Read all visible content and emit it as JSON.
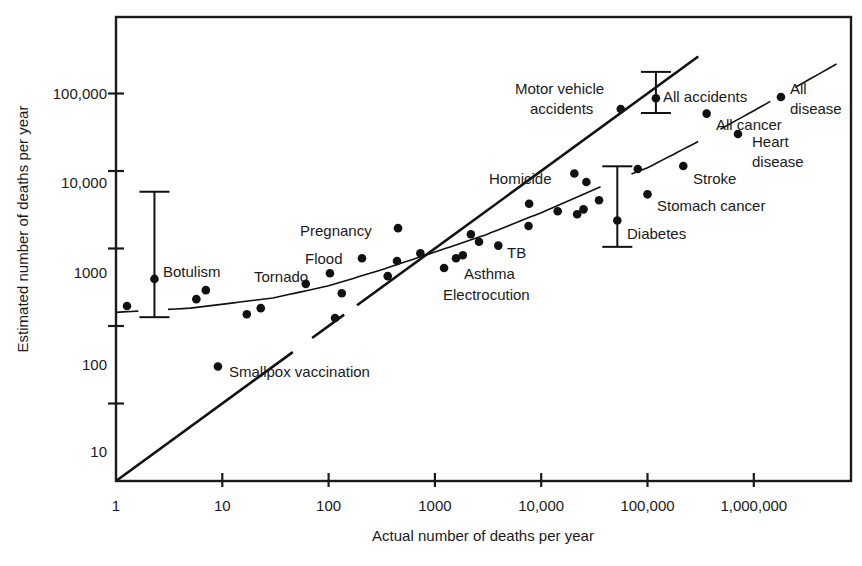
{
  "chart_data": {
    "type": "scatter",
    "title": "",
    "xlabel": "Actual number of deaths per year",
    "ylabel": "Estimated number of deaths per year",
    "xscale": "log",
    "yscale": "log",
    "xlim": [
      1,
      7000000
    ],
    "ylim": [
      1,
      450000
    ],
    "grid": false,
    "legend": null,
    "x_ticks": [
      {
        "value": 1,
        "label": "1"
      },
      {
        "value": 10,
        "label": "10"
      },
      {
        "value": 100,
        "label": "100"
      },
      {
        "value": 1000,
        "label": "1000"
      },
      {
        "value": 10000,
        "label": "10,000"
      },
      {
        "value": 100000,
        "label": "100,000"
      },
      {
        "value": 1000000,
        "label": "1,000,000"
      }
    ],
    "y_ticks": [
      {
        "value": 10,
        "label": "10"
      },
      {
        "value": 100,
        "label": "100"
      },
      {
        "value": 1000,
        "label": "1000"
      },
      {
        "value": 10000,
        "label": "10,000"
      },
      {
        "value": 100000,
        "label": "100,000"
      }
    ],
    "series": [
      {
        "name": "Causes of death",
        "points": [
          {
            "x": 1.27,
            "y": 181,
            "label": ""
          },
          {
            "x": 2.3,
            "y": 405,
            "label": "Botulism"
          },
          {
            "x": 5.7,
            "y": 222,
            "label": ""
          },
          {
            "x": 7.0,
            "y": 290,
            "label": ""
          },
          {
            "x": 9.1,
            "y": 30,
            "label": "Smallpox vaccination"
          },
          {
            "x": 17,
            "y": 142,
            "label": ""
          },
          {
            "x": 23,
            "y": 170,
            "label": ""
          },
          {
            "x": 61,
            "y": 350,
            "label": "Tornado"
          },
          {
            "x": 103,
            "y": 480,
            "label": ""
          },
          {
            "x": 115,
            "y": 127,
            "label": ""
          },
          {
            "x": 133,
            "y": 265,
            "label": ""
          },
          {
            "x": 206,
            "y": 750,
            "label": "Flood"
          },
          {
            "x": 360,
            "y": 440,
            "label": ""
          },
          {
            "x": 440,
            "y": 690,
            "label": ""
          },
          {
            "x": 450,
            "y": 1830,
            "label": "Pregnancy"
          },
          {
            "x": 730,
            "y": 870,
            "label": ""
          },
          {
            "x": 1220,
            "y": 560,
            "label": "Electrocution"
          },
          {
            "x": 1580,
            "y": 750,
            "label": "Asthma"
          },
          {
            "x": 1830,
            "y": 820,
            "label": ""
          },
          {
            "x": 2180,
            "y": 1530,
            "label": ""
          },
          {
            "x": 2600,
            "y": 1220,
            "label": ""
          },
          {
            "x": 3950,
            "y": 1090,
            "label": "TB"
          },
          {
            "x": 7600,
            "y": 1950,
            "label": ""
          },
          {
            "x": 7700,
            "y": 3780,
            "label": ""
          },
          {
            "x": 14300,
            "y": 3030,
            "label": ""
          },
          {
            "x": 20500,
            "y": 9300,
            "label": "Homicide"
          },
          {
            "x": 21800,
            "y": 2770,
            "label": ""
          },
          {
            "x": 25000,
            "y": 3200,
            "label": ""
          },
          {
            "x": 26600,
            "y": 7200,
            "label": ""
          },
          {
            "x": 35000,
            "y": 4200,
            "label": ""
          },
          {
            "x": 52000,
            "y": 2300,
            "label": "Diabetes"
          },
          {
            "x": 56000,
            "y": 63000,
            "label": "Motor vehicle accidents"
          },
          {
            "x": 81000,
            "y": 10600,
            "label": ""
          },
          {
            "x": 100000,
            "y": 5000,
            "label": "Stomach cancer"
          },
          {
            "x": 120000,
            "y": 87000,
            "label": "All accidents"
          },
          {
            "x": 217000,
            "y": 11600,
            "label": "Stroke"
          },
          {
            "x": 360000,
            "y": 55000,
            "label": "All cancer"
          },
          {
            "x": 710000,
            "y": 30000,
            "label": "Heart disease"
          },
          {
            "x": 1800000,
            "y": 90000,
            "label": "All disease"
          }
        ]
      }
    ],
    "error_bars": [
      {
        "label": "Botulism",
        "x": 2.3,
        "y_low": 130,
        "y_high": 5400
      },
      {
        "label": "Diabetes",
        "x": 52000,
        "y_low": 1050,
        "y_high": 11500
      },
      {
        "label": "All accidents",
        "x": 120000,
        "y_low": 56000,
        "y_high": 190000
      }
    ],
    "reference_lines": [
      {
        "name": "Perfect accuracy (estimate = actual)",
        "type": "identity"
      },
      {
        "name": "Best-fit curve",
        "type": "quadratic-fit",
        "points": [
          [
            1,
            150
          ],
          [
            5,
            170
          ],
          [
            30,
            230
          ],
          [
            100,
            330
          ],
          [
            300,
            520
          ],
          [
            1000,
            900
          ],
          [
            3000,
            1500
          ],
          [
            10000,
            2900
          ],
          [
            50000,
            7600
          ],
          [
            100000,
            11000
          ],
          [
            300000,
            24000
          ],
          [
            1000000,
            60000
          ],
          [
            6000000,
            240000
          ]
        ]
      }
    ],
    "annotations": [
      {
        "text": "Botulism",
        "px": 163,
        "py": 272
      },
      {
        "text": "Tornado",
        "px": 254,
        "py": 277
      },
      {
        "text": "Flood",
        "px": 305,
        "py": 259
      },
      {
        "text": "Pregnancy",
        "px": 300,
        "py": 231
      },
      {
        "text": "Smallpox vaccination",
        "px": 229,
        "py": 372
      },
      {
        "text": "Asthma",
        "px": 464,
        "py": 274
      },
      {
        "text": "Electrocution",
        "px": 443,
        "py": 295
      },
      {
        "text": "TB",
        "px": 507,
        "py": 253
      },
      {
        "text": "Homicide",
        "px": 489,
        "py": 179
      },
      {
        "text": "Diabetes",
        "px": 627,
        "py": 234
      },
      {
        "text": "Stomach cancer",
        "px": 657,
        "py": 206
      },
      {
        "text": "Stroke",
        "px": 693,
        "py": 179
      },
      {
        "text": "Motor vehicle",
        "px": 515,
        "py": 89
      },
      {
        "text": "accidents",
        "px": 530,
        "py": 109
      },
      {
        "text": "All accidents",
        "px": 663,
        "py": 97
      },
      {
        "text": "All cancer",
        "px": 716,
        "py": 125
      },
      {
        "text": "Heart",
        "px": 752,
        "py": 142
      },
      {
        "text": "disease",
        "px": 752,
        "py": 162
      },
      {
        "text": "All",
        "px": 790,
        "py": 89
      },
      {
        "text": "disease",
        "px": 790,
        "py": 109
      }
    ]
  },
  "layout": {
    "plot": {
      "left": 116,
      "top": 17,
      "right": 851,
      "bottom": 481
    },
    "x_px_per_decade": 106.3,
    "y_px_per_decade": 77.5,
    "y_tick_label_positions": [
      452,
      365,
      273,
      183,
      94
    ]
  }
}
